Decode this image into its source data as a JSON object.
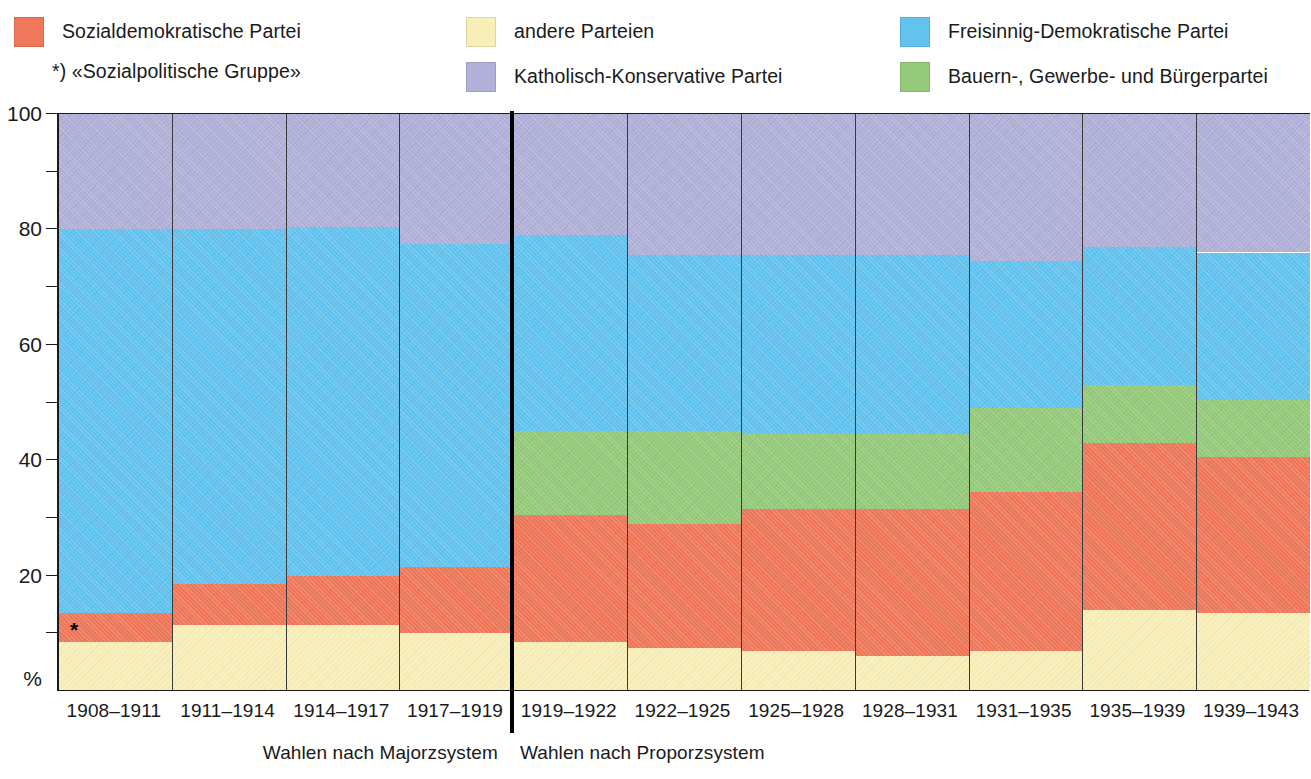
{
  "legend": {
    "items": [
      {
        "key": "sp",
        "label": "Sozialdemokratische Partei",
        "color": "#f0785a"
      },
      {
        "key": "and",
        "label": "andere Parteien",
        "color": "#f8eeb8"
      },
      {
        "key": "fdp",
        "label": "Freisinnig-Demokratische Partei",
        "color": "#63c3ef"
      },
      {
        "key": "kk",
        "label": "Katholisch-Konservative Partei",
        "color": "#b0b0d8"
      },
      {
        "key": "bgb",
        "label": "Bauern-, Gewerbe- und Bürgerpartei",
        "color": "#95ca7b"
      }
    ],
    "footnote": "*) «Sozialpolitische Gruppe»"
  },
  "axis": {
    "y_unit": "%",
    "y_major_labels": [
      "100",
      "80",
      "60",
      "40",
      "20"
    ],
    "y_major_values": [
      100,
      80,
      60,
      40,
      20
    ],
    "y_minor_values": [
      90,
      70,
      50,
      30,
      10
    ],
    "y_min": 0,
    "y_max": 100
  },
  "systems": {
    "majorz_label": "Wahlen nach Majorzsystem",
    "proporz_label": "Wahlen nach Proporzsystem",
    "majorz_periods": 4,
    "proporz_periods": 7
  },
  "star_marker": "*",
  "chart_data": {
    "type": "area",
    "title": "",
    "xlabel": "",
    "ylabel": "%",
    "ylim": [
      0,
      100
    ],
    "grid": false,
    "legend_position": "top",
    "stack_order": [
      "andere Parteien",
      "Sozialdemokratische Partei",
      "Bauern-, Gewerbe- und Bürgerpartei",
      "Freisinnig-Demokratische Partei",
      "Katholisch-Konservative Partei"
    ],
    "categories": [
      "1908–1911",
      "1911–1914",
      "1914–1917",
      "1917–1919",
      "1919–1922",
      "1922–1925",
      "1925–1928",
      "1928–1931",
      "1931–1935",
      "1935–1939",
      "1939–1943"
    ],
    "series": [
      {
        "name": "andere Parteien",
        "color": "#f8eeb8",
        "values": [
          8.5,
          11.5,
          11.5,
          10.0,
          8.5,
          7.5,
          7.0,
          6.0,
          7.0,
          14.0,
          13.5
        ]
      },
      {
        "name": "Sozialdemokratische Partei",
        "color": "#f0785a",
        "values": [
          5.0,
          7.0,
          8.5,
          11.5,
          22.0,
          21.5,
          24.5,
          25.5,
          27.5,
          29.0,
          27.0
        ]
      },
      {
        "name": "Bauern-, Gewerbe- und Bürgerpartei",
        "color": "#95ca7b",
        "values": [
          0.0,
          0.0,
          0.0,
          0.0,
          14.5,
          16.0,
          13.0,
          13.0,
          14.5,
          10.0,
          10.0
        ]
      },
      {
        "name": "Freisinnig-Demokratische Partei",
        "color": "#63c3ef",
        "values": [
          66.5,
          61.5,
          60.5,
          56.0,
          34.0,
          30.5,
          31.0,
          31.0,
          25.5,
          24.0,
          25.5
        ]
      },
      {
        "name": "Katholisch-Konservative Partei",
        "color": "#b0b0d8",
        "values": [
          20.0,
          20.0,
          19.5,
          22.5,
          21.0,
          24.5,
          24.5,
          24.5,
          25.5,
          23.0,
          24.0
        ]
      }
    ],
    "cumulative_tops": [
      {
        "category": "1908–1911",
        "andere": 8.5,
        "sp": 13.5,
        "bgb": 13.5,
        "fdp": 80.0,
        "kk": 100
      },
      {
        "category": "1911–1914",
        "andere": 11.5,
        "sp": 18.5,
        "bgb": 18.5,
        "fdp": 80.0,
        "kk": 100
      },
      {
        "category": "1914–1917",
        "andere": 11.5,
        "sp": 20.0,
        "bgb": 20.0,
        "fdp": 80.5,
        "kk": 100
      },
      {
        "category": "1917–1919",
        "andere": 10.0,
        "sp": 21.5,
        "bgb": 21.5,
        "fdp": 77.5,
        "kk": 100
      },
      {
        "category": "1919–1922",
        "andere": 8.5,
        "sp": 30.5,
        "bgb": 45.0,
        "fdp": 79.0,
        "kk": 100
      },
      {
        "category": "1922–1925",
        "andere": 7.5,
        "sp": 29.0,
        "bgb": 45.0,
        "fdp": 75.5,
        "kk": 100
      },
      {
        "category": "1925–1928",
        "andere": 7.0,
        "sp": 31.5,
        "bgb": 44.5,
        "fdp": 75.5,
        "kk": 100
      },
      {
        "category": "1928–1931",
        "andere": 6.0,
        "sp": 31.5,
        "bgb": 44.5,
        "fdp": 75.5,
        "kk": 100
      },
      {
        "category": "1931–1935",
        "andere": 7.0,
        "sp": 34.5,
        "bgb": 49.0,
        "fdp": 74.5,
        "kk": 100
      },
      {
        "category": "1935–1939",
        "andere": 14.0,
        "sp": 43.0,
        "bgb": 53.0,
        "fdp": 77.0,
        "kk": 100
      },
      {
        "category": "1939–1943",
        "andere": 13.5,
        "sp": 40.5,
        "bgb": 50.5,
        "fdp": 76.0,
        "kk": 100
      }
    ]
  }
}
